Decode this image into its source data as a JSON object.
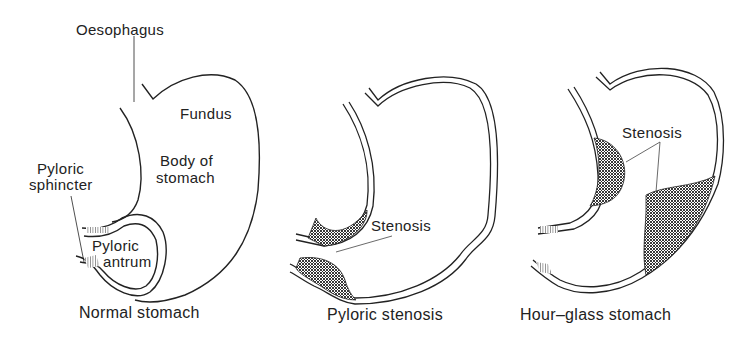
{
  "figure": {
    "panels": [
      {
        "caption": "Normal stomach",
        "labels": {
          "oesophagus": "Oesophagus",
          "fundus": "Fundus",
          "body_line1": "Body of",
          "body_line2": "stomach",
          "sphincter_line1": "Pyloric",
          "sphincter_line2": "sphincter",
          "antrum_line1": "Pyloric",
          "antrum_line2": "antrum"
        }
      },
      {
        "caption": "Pyloric stenosis",
        "labels": {
          "stenosis": "Stenosis"
        }
      },
      {
        "caption": "Hour–glass stomach",
        "labels": {
          "stenosis": "Stenosis"
        }
      }
    ],
    "colors": {
      "line": "#222222",
      "background": "#ffffff",
      "hatch": "#333333"
    }
  }
}
